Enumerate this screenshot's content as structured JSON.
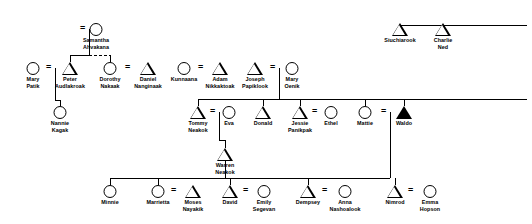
{
  "diagram": {
    "symbol_legend": {
      "circle": "female",
      "triangle": "male",
      "filled-triangle": "ego / deceased",
      "equals": "marriage union"
    },
    "line_color": "#000000",
    "background": "#ffffff"
  },
  "persons": [
    {
      "id": "samantha",
      "name": "Samantha\nAhvakana",
      "label_lines": [
        "Samantha",
        "Ahvakana"
      ],
      "sex": "female",
      "filled": false,
      "x": 96,
      "y": 23
    },
    {
      "id": "mary_patik",
      "name": "Mary Patik",
      "label_lines": [
        "Mary",
        "Patik"
      ],
      "sex": "female",
      "filled": false,
      "x": 33,
      "y": 62
    },
    {
      "id": "peter",
      "name": "Peter Audlakroak",
      "label_lines": [
        "Peter",
        "Audlakroak"
      ],
      "sex": "male",
      "filled": false,
      "x": 70,
      "y": 62
    },
    {
      "id": "dorothy",
      "name": "Dorothy Nakaak",
      "label_lines": [
        "Dorothy",
        "Nakaak"
      ],
      "sex": "female",
      "filled": false,
      "x": 110,
      "y": 62
    },
    {
      "id": "daniel",
      "name": "Daniel Nanginaak",
      "label_lines": [
        "Daniel",
        "Nanginaak"
      ],
      "sex": "male",
      "filled": false,
      "x": 148,
      "y": 62
    },
    {
      "id": "kunnaana",
      "name": "Kunnaana",
      "label_lines": [
        "Kunnaana"
      ],
      "sex": "female",
      "filled": false,
      "x": 184,
      "y": 62
    },
    {
      "id": "adam",
      "name": "Adam Nikkaktoak",
      "label_lines": [
        "Adam",
        "Nikkaktoak"
      ],
      "sex": "male",
      "filled": false,
      "x": 220,
      "y": 62
    },
    {
      "id": "joseph",
      "name": "Joseph Papiklook",
      "label_lines": [
        "Joseph",
        "Papiklook"
      ],
      "sex": "male",
      "filled": false,
      "x": 255,
      "y": 62
    },
    {
      "id": "mary_oenik",
      "name": "Mary Oenik",
      "label_lines": [
        "Mary",
        "Oenik"
      ],
      "sex": "female",
      "filled": false,
      "x": 292,
      "y": 62
    },
    {
      "id": "siuchiarook",
      "name": "Siuchiarook",
      "label_lines": [
        "Siuchiarook"
      ],
      "sex": "male",
      "filled": false,
      "x": 400,
      "y": 23
    },
    {
      "id": "charlie_ned",
      "name": "Charlie Ned",
      "label_lines": [
        "Charlie",
        "Ned"
      ],
      "sex": "male",
      "filled": false,
      "x": 443,
      "y": 23
    },
    {
      "id": "nannie",
      "name": "Nannie Kagak",
      "label_lines": [
        "Nannie",
        "Kagak"
      ],
      "sex": "female",
      "filled": false,
      "x": 60,
      "y": 106
    },
    {
      "id": "tommy",
      "name": "Tommy Neakok",
      "label_lines": [
        "Tommy",
        "Neakok"
      ],
      "sex": "male",
      "filled": false,
      "x": 198,
      "y": 106
    },
    {
      "id": "eva",
      "name": "Eva",
      "label_lines": [
        "Eva"
      ],
      "sex": "female",
      "filled": false,
      "x": 229,
      "y": 106
    },
    {
      "id": "donald",
      "name": "Donald",
      "label_lines": [
        "Donald"
      ],
      "sex": "male",
      "filled": false,
      "x": 263,
      "y": 106
    },
    {
      "id": "jessie",
      "name": "Jessie Panikpak",
      "label_lines": [
        "Jessie",
        "Panikpak"
      ],
      "sex": "male",
      "filled": false,
      "x": 300,
      "y": 106
    },
    {
      "id": "ethel",
      "name": "Ethel",
      "label_lines": [
        "Ethel"
      ],
      "sex": "female",
      "filled": false,
      "x": 331,
      "y": 106
    },
    {
      "id": "mattie",
      "name": "Mattie",
      "label_lines": [
        "Mattie"
      ],
      "sex": "female",
      "filled": false,
      "x": 365,
      "y": 106
    },
    {
      "id": "waldo",
      "name": "Waldo",
      "label_lines": [
        "Waldo"
      ],
      "sex": "male",
      "filled": true,
      "x": 404,
      "y": 106
    },
    {
      "id": "warren",
      "name": "Warren Neakok",
      "label_lines": [
        "Warren",
        "Neakok"
      ],
      "sex": "male",
      "filled": false,
      "x": 225,
      "y": 148
    },
    {
      "id": "minnie",
      "name": "Minnie",
      "label_lines": [
        "Minnie"
      ],
      "sex": "female",
      "filled": false,
      "x": 110,
      "y": 185
    },
    {
      "id": "marrietta",
      "name": "Marrietta",
      "label_lines": [
        "Marrietta"
      ],
      "sex": "female",
      "filled": false,
      "x": 158,
      "y": 185
    },
    {
      "id": "moses",
      "name": "Moses Nayakik",
      "label_lines": [
        "Moses",
        "Nayakik"
      ],
      "sex": "male",
      "filled": false,
      "x": 193,
      "y": 185
    },
    {
      "id": "david",
      "name": "David",
      "label_lines": [
        "David"
      ],
      "sex": "male",
      "filled": false,
      "x": 230,
      "y": 185
    },
    {
      "id": "emily",
      "name": "Emily Segevan",
      "label_lines": [
        "Emily",
        "Segevan"
      ],
      "sex": "female",
      "filled": false,
      "x": 264,
      "y": 185
    },
    {
      "id": "dempsey",
      "name": "Dempsey",
      "label_lines": [
        "Dempsey"
      ],
      "sex": "male",
      "filled": false,
      "x": 308,
      "y": 185
    },
    {
      "id": "anna",
      "name": "Anna Nashoalook",
      "label_lines": [
        "Anna",
        "Nashoalook"
      ],
      "sex": "female",
      "filled": false,
      "x": 345,
      "y": 185
    },
    {
      "id": "nimrod",
      "name": "Nimrod",
      "label_lines": [
        "Nimrod"
      ],
      "sex": "male",
      "filled": false,
      "x": 395,
      "y": 185
    },
    {
      "id": "emma",
      "name": "Emma Hopson",
      "label_lines": [
        "Emma",
        "Hopson"
      ],
      "sex": "female",
      "filled": false,
      "x": 430,
      "y": 185
    }
  ],
  "marriages": [
    {
      "left": "peter",
      "right": "samantha",
      "x": 84,
      "y": 23
    },
    {
      "left": "mary_patik",
      "right": "peter",
      "x": 50,
      "y": 62
    },
    {
      "left": "dorothy",
      "right": "daniel",
      "x": 129,
      "y": 62
    },
    {
      "left": "kunnaana",
      "right": "adam",
      "x": 202,
      "y": 62
    },
    {
      "left": "joseph",
      "right": "mary_oenik",
      "x": 274,
      "y": 62
    },
    {
      "left": "tommy",
      "right": "eva",
      "x": 214,
      "y": 106
    },
    {
      "left": "jessie",
      "right": "ethel",
      "x": 316,
      "y": 106
    },
    {
      "left": "mattie",
      "right": "waldo",
      "x": 385,
      "y": 106
    },
    {
      "left": "marrietta",
      "right": "moses",
      "x": 175,
      "y": 185
    },
    {
      "left": "david",
      "right": "emily",
      "x": 247,
      "y": 185
    },
    {
      "left": "dempsey",
      "right": "anna",
      "x": 326,
      "y": 185
    },
    {
      "left": "nimrod",
      "right": "emma",
      "x": 412,
      "y": 185
    }
  ],
  "descent_groups": [
    {
      "parents": "peter+samantha",
      "children": [
        "peter-sib",
        "dorothy-sib"
      ],
      "bar_y": 55
    },
    {
      "parents": "mary_patik+peter",
      "children": [
        "nannie"
      ],
      "bar_y": 94
    },
    {
      "parents": "siuchiarook+charlie_ned",
      "children": [],
      "bar_y": 25
    },
    {
      "parents": "joseph+mary_oenik",
      "children": [
        "tommy",
        "donald",
        "jessie",
        "mattie",
        "waldo"
      ],
      "bar_y": 99
    },
    {
      "parents": "tommy+eva",
      "children": [
        "warren"
      ],
      "bar_y": 140
    },
    {
      "parents": "warren",
      "children": [
        "minnie",
        "marrietta",
        "david",
        "dempsey",
        "nimrod"
      ],
      "bar_y": 178
    }
  ]
}
